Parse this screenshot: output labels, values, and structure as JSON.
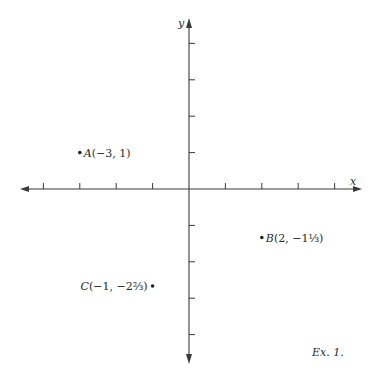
{
  "figure": {
    "caption": "Ex. 1.",
    "axes": {
      "x_label": "x",
      "y_label": "y",
      "x_ticks": [
        -4,
        -3,
        -2,
        -1,
        1,
        2,
        3,
        4
      ],
      "y_ticks": [
        -4,
        -3,
        -2,
        -1,
        1,
        2,
        3,
        4
      ],
      "unit_px": 36.4,
      "origin_px": [
        189,
        189
      ]
    },
    "points": [
      {
        "name": "A",
        "coords_text": "(−3, 1)",
        "x": -3,
        "y": 1,
        "label_side": "right"
      },
      {
        "name": "B",
        "coords_text": "(2, −1⅓)",
        "x": 2,
        "y": -1.3333,
        "label_side": "right"
      },
      {
        "name": "C",
        "coords_text": "(−1, −2⅔)",
        "x": -1,
        "y": -2.6667,
        "label_side": "left"
      }
    ]
  },
  "chart_data": {
    "type": "scatter",
    "title": "",
    "xlabel": "x",
    "ylabel": "y",
    "xlim": [
      -4.5,
      4.5
    ],
    "ylim": [
      -4.8,
      4.6
    ],
    "grid": false,
    "series": [
      {
        "name": "points",
        "x": [
          -3,
          2,
          -1
        ],
        "y": [
          1,
          -1.3333,
          -2.6667
        ],
        "labels": [
          "A(−3, 1)",
          "B(2, −1⅓)",
          "C(−1, −2⅔)"
        ]
      }
    ],
    "annotation": "Ex. 1."
  }
}
